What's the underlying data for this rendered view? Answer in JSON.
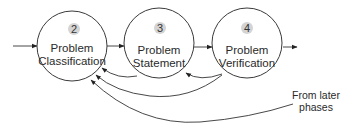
{
  "diagram": {
    "type": "process-flow",
    "nodes": [
      {
        "id": "n2",
        "number": "2",
        "line1": "Problem",
        "line2": "Classification"
      },
      {
        "id": "n3",
        "number": "3",
        "line1": "Problem",
        "line2": "Statement"
      },
      {
        "id": "n4",
        "number": "4",
        "line1": "Problem",
        "line2": "Verification"
      }
    ],
    "edges": [
      {
        "from": "input",
        "to": "n2",
        "kind": "forward"
      },
      {
        "from": "n2",
        "to": "n3",
        "kind": "forward"
      },
      {
        "from": "n3",
        "to": "n4",
        "kind": "forward"
      },
      {
        "from": "n4",
        "to": "output",
        "kind": "forward"
      },
      {
        "from": "n3",
        "to": "n2",
        "kind": "feedback"
      },
      {
        "from": "n4",
        "to": "n3",
        "kind": "feedback"
      },
      {
        "from": "n4",
        "to": "n2",
        "kind": "feedback"
      },
      {
        "from": "later-phases",
        "to": "n2",
        "kind": "feedback"
      }
    ],
    "annotation": {
      "line1": "From later",
      "line2": "phases"
    },
    "colors": {
      "stroke": "#333333",
      "badge": "#d4d4d4",
      "background": "#ffffff"
    }
  }
}
